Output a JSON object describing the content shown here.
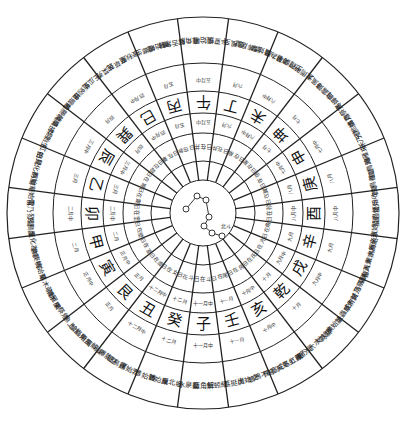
{
  "diagram": {
    "center": {
      "x": 203,
      "y": 213
    },
    "radii": {
      "outer": 196,
      "pheno_inner": 150,
      "month_inner": 122,
      "dir_inner": 100,
      "tiny_inner": 80,
      "sun_inner": 52,
      "core": 33
    },
    "directions": [
      "子",
      "癸",
      "丑",
      "艮",
      "寅",
      "甲",
      "卯",
      "乙",
      "辰",
      "巽",
      "巳",
      "丙",
      "午",
      "丁",
      "未",
      "坤",
      "申",
      "庚",
      "酉",
      "辛",
      "戌",
      "乾",
      "亥",
      "壬"
    ],
    "months": [
      "十一月中",
      "十二月",
      "十二月中",
      "正月",
      "正月中",
      "二月",
      "二月中",
      "三月",
      "三月中",
      "四月",
      "四月中",
      "五月",
      "五月中",
      "六月",
      "六月中",
      "七月",
      "七月中",
      "八月",
      "八月中",
      "九月",
      "九月中",
      "十月",
      "十月中",
      "十一月"
    ],
    "sun_positions": [
      "日在斗",
      "日在斗",
      "日在女",
      "日在虛",
      "日在室",
      "日在壁",
      "日在奎",
      "日在婁",
      "日在胃",
      "日在昴",
      "日在畢",
      "日在參",
      "日在井",
      "日在井",
      "日在柳",
      "日在星",
      "日在張",
      "日在翼",
      "日在軫",
      "日在角",
      "日在亢",
      "日在氐",
      "日在房",
      "日在尾"
    ],
    "phenology": [
      "蚯蚓結 麋角解 水泉動",
      "雁北鄉 鵲始巢 雉始雊",
      "雞始乳 征鳥厲 水澤腹堅",
      "東風解凍 蟄蟲始振 魚上冰",
      "獺祭魚 鴻雁來 草木萌動",
      "桃始華 倉庚鳴 鷹化為鳩",
      "玄鳥至 雷乃發聲 始電",
      "桐始華 田鼠化為鴽 虹始見",
      "萍始生 鳴鳩拂羽 戴勝降桑",
      "螻蟈鳴 蚯蚓出 王瓜生",
      "苦菜秀 靡草死 麥秋至",
      "螳螂生 鵙始鳴 反舌無聲",
      "鹿角解 蜩始鳴 半夏生",
      "溫風至 蟋蟀居壁 鷹始摯",
      "腐草為螢 土潤溽暑 大雨時行",
      "涼風至 白露降 寒蟬鳴",
      "鷹乃祭鳥 天地始肅 禾乃登",
      "鴻雁來 玄鳥歸 群鳥養羞",
      "雷始收聲 蟄蟲坯戶 水始涸",
      "鴻雁來賓 雀入大水為蛤 菊有黃華",
      "豺乃祭獸 草木黃落 蟄蟲咸俯",
      "水始冰 地始凍 雉入大水為蜃",
      "虹藏不見 天氣上騰 閉塞成冬",
      "鶡鴠不鳴 虎始交 荔挺出"
    ],
    "dipper": {
      "label": "北斗",
      "stars": [
        [
          186,
          209
        ],
        [
          197,
          196
        ],
        [
          206,
          200
        ],
        [
          209,
          217
        ],
        [
          204,
          226
        ],
        [
          212,
          233
        ],
        [
          222,
          236
        ]
      ]
    },
    "colors": {
      "ink": "#222222",
      "paper": "#ffffff"
    }
  }
}
